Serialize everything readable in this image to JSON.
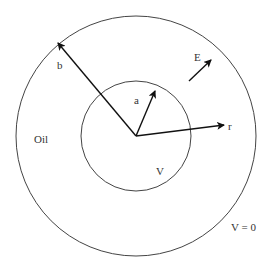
{
  "diagram": {
    "colors": {
      "background": "#ffffff",
      "stroke": "#444444",
      "arrow": "#111111",
      "text": "#333333"
    },
    "center": {
      "x": 136,
      "y": 136
    },
    "outer_circle": {
      "radius": 120
    },
    "inner_circle": {
      "radius": 55
    },
    "labels": {
      "b": "b",
      "a": "a",
      "r": "r",
      "E": "E",
      "oil": "Oil",
      "inner_potential": "V",
      "outer_potential": "V = 0"
    },
    "arrows": [
      {
        "id": "b",
        "from": [
          136,
          136
        ],
        "to": [
          58,
          43
        ]
      },
      {
        "id": "a",
        "from": [
          136,
          136
        ],
        "to": [
          155,
          91
        ]
      },
      {
        "id": "r",
        "from": [
          136,
          136
        ],
        "to": [
          224,
          125
        ]
      },
      {
        "id": "E",
        "from": [
          189,
          81
        ],
        "to": [
          211,
          60
        ]
      }
    ]
  }
}
